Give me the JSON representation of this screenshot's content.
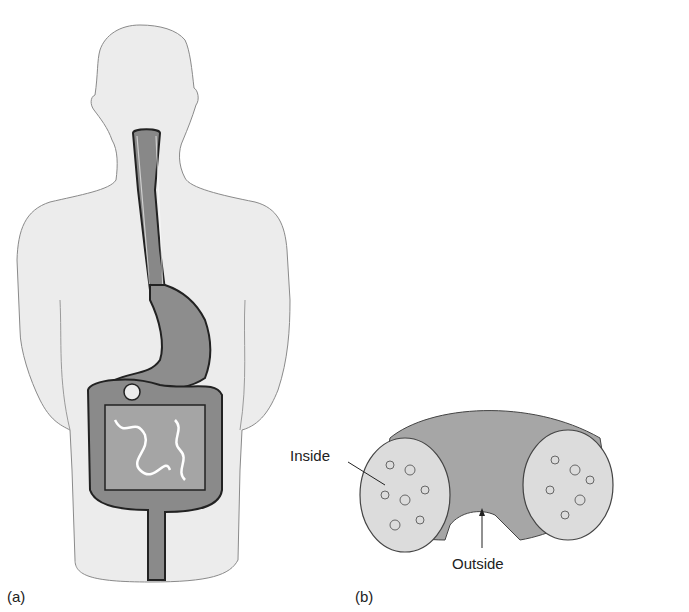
{
  "figure": {
    "panel_a": {
      "label": "(a)",
      "subject": "human silhouette with digestive tract (esophagus, stomach, intestines)"
    },
    "panel_b": {
      "label": "(b)",
      "subject": "bent tube (torus section) cross-section",
      "annotations": {
        "inside": "Inside",
        "outside": "Outside"
      }
    }
  },
  "colors": {
    "body_fill": "#ececec",
    "body_stroke": "#8a8a8a",
    "organ_fill": "#8d8d8d",
    "organ_dark": "#555555",
    "tube_fill": "#a8a8a8",
    "section_fill": "#dcdcdc"
  }
}
